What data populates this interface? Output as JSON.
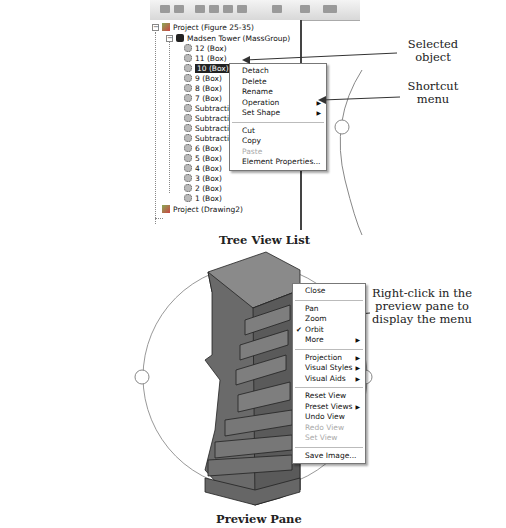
{
  "tree_view": {
    "caption": "Tree View List",
    "items": [
      {
        "label": "Project (Figure 25-35)",
        "icon": "project-icon",
        "level": 0,
        "expanded": true
      },
      {
        "label": "Madsen Tower (MassGroup)",
        "icon": "mass-group-icon",
        "level": 1,
        "expanded": true
      },
      {
        "label": "12 (Box)",
        "icon": "mass-element-icon",
        "level": 2
      },
      {
        "label": "11 (Box)",
        "icon": "mass-element-icon",
        "level": 2
      },
      {
        "label": "10 (Box)",
        "icon": "mass-element-icon",
        "level": 2,
        "selected": true
      },
      {
        "label": "9 (Box)",
        "icon": "mass-element-icon",
        "level": 2
      },
      {
        "label": "8 (Box)",
        "icon": "mass-element-icon",
        "level": 2
      },
      {
        "label": "7 (Box)",
        "icon": "mass-element-icon",
        "level": 2
      },
      {
        "label": "Subtraction",
        "icon": "mass-element-icon",
        "level": 2
      },
      {
        "label": "Subtraction",
        "icon": "mass-element-icon",
        "level": 2
      },
      {
        "label": "Subtraction",
        "icon": "mass-element-icon",
        "level": 2
      },
      {
        "label": "Subtraction",
        "icon": "mass-element-icon",
        "level": 2
      },
      {
        "label": "6 (Box)",
        "icon": "mass-element-icon",
        "level": 2
      },
      {
        "label": "5 (Box)",
        "icon": "mass-element-icon",
        "level": 2
      },
      {
        "label": "4 (Box)",
        "icon": "mass-element-icon",
        "level": 2
      },
      {
        "label": "3 (Box)",
        "icon": "mass-element-icon",
        "level": 2
      },
      {
        "label": "2 (Box)",
        "icon": "mass-element-icon",
        "level": 2
      },
      {
        "label": "1 (Box)",
        "icon": "mass-element-icon",
        "level": 2
      },
      {
        "label": "Project (Drawing2)",
        "icon": "project-icon",
        "level": 0
      }
    ],
    "context_menu": [
      {
        "label": "Detach"
      },
      {
        "label": "Delete"
      },
      {
        "label": "Rename"
      },
      {
        "label": "Operation",
        "submenu": true
      },
      {
        "label": "Set Shape",
        "submenu": true
      },
      {
        "separator": true
      },
      {
        "label": "Cut"
      },
      {
        "label": "Copy"
      },
      {
        "label": "Paste",
        "disabled": true
      },
      {
        "label": "Element Properties..."
      }
    ]
  },
  "preview_pane": {
    "caption": "Preview Pane",
    "context_menu": [
      {
        "label": "Close"
      },
      {
        "separator": true
      },
      {
        "label": "Pan"
      },
      {
        "label": "Zoom"
      },
      {
        "label": "Orbit",
        "checked": true
      },
      {
        "label": "More",
        "submenu": true
      },
      {
        "separator": true
      },
      {
        "label": "Projection",
        "submenu": true
      },
      {
        "label": "Visual Styles",
        "submenu": true
      },
      {
        "label": "Visual Aids",
        "submenu": true
      },
      {
        "separator": true
      },
      {
        "label": "Reset View"
      },
      {
        "label": "Preset Views",
        "submenu": true
      },
      {
        "label": "Undo View"
      },
      {
        "label": "Redo View",
        "disabled": true
      },
      {
        "label": "Set View",
        "disabled": true
      },
      {
        "separator": true
      },
      {
        "label": "Save Image..."
      }
    ]
  },
  "callouts": {
    "selected_object": "Selected object",
    "shortcut_menu": "Shortcut menu",
    "right_click": "Right-click in the preview pane to display the menu"
  },
  "glyphs": {
    "submenu_arrow": "▶",
    "check": "✔",
    "minus": "−"
  },
  "colors": {
    "selection_bg": "#222222",
    "menu_border": "#777777",
    "disabled_text": "#aaaaaa",
    "tower_fill": "#6e6e6e"
  }
}
